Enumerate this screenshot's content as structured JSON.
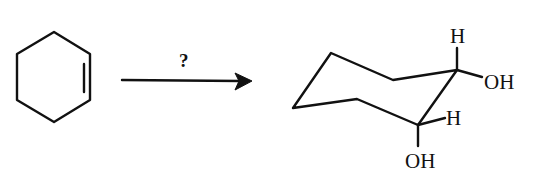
{
  "diagram": {
    "type": "reaction-scheme",
    "reactant": {
      "name": "cyclohexene",
      "depiction": "hexagon with one double bond"
    },
    "arrow": {
      "reagent_label": "?"
    },
    "product": {
      "name": "cis-1,2-cyclohexanediol (chair conformation)",
      "labels": {
        "h_top": "H",
        "oh_right": "OH",
        "h_middle": "H",
        "oh_bottom": "OH"
      }
    }
  }
}
